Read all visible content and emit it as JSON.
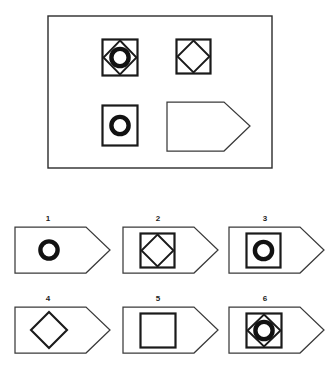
{
  "page": {
    "background_color": "#ffffff",
    "ink_color": "#1a1a1a",
    "width": 327,
    "height": 372
  },
  "problem_panel": {
    "name": "problem-matrix",
    "frame_shape": "rectangle",
    "frame": {
      "x": 48,
      "y": 16,
      "w": 224,
      "h": 152
    },
    "cells": [
      {
        "id": "cell-r1c1",
        "position": "row1-col1",
        "shapes": [
          "square",
          "diamond",
          "thick-circle"
        ],
        "box": {
          "x": 102,
          "y": 39,
          "w": 35,
          "h": 37
        }
      },
      {
        "id": "cell-r1c2",
        "position": "row1-col2",
        "shapes": [
          "square",
          "diamond"
        ],
        "box": {
          "x": 176,
          "y": 39,
          "w": 35,
          "h": 34
        }
      },
      {
        "id": "cell-r2c1",
        "position": "row2-col1",
        "shapes": [
          "square",
          "thick-circle"
        ],
        "box": {
          "x": 102,
          "y": 105,
          "w": 35,
          "h": 41
        }
      },
      {
        "id": "cell-r2c2-answer",
        "position": "row2-col2",
        "shapes": [
          "pentagon-tag"
        ],
        "is_answer_slot": true,
        "box": {
          "x": 166,
          "y": 101,
          "w": 85,
          "h": 50
        }
      }
    ]
  },
  "options_panel": {
    "name": "answer-options",
    "columns": 3,
    "rows": 2,
    "options": [
      {
        "number": "1",
        "label_x": 48,
        "label_y": 216,
        "tag": {
          "x": 14,
          "y": 226,
          "w": 83,
          "h": 48
        },
        "shapes": [
          "thick-circle"
        ]
      },
      {
        "number": "2",
        "label_x": 158,
        "label_y": 216,
        "tag": {
          "x": 122,
          "y": 226,
          "w": 83,
          "h": 48
        },
        "shapes": [
          "square",
          "diamond"
        ]
      },
      {
        "number": "3",
        "label_x": 265,
        "label_y": 216,
        "tag": {
          "x": 228,
          "y": 226,
          "w": 83,
          "h": 48
        },
        "shapes": [
          "square",
          "thick-circle"
        ]
      },
      {
        "number": "4",
        "label_x": 48,
        "label_y": 296,
        "tag": {
          "x": 14,
          "y": 306,
          "w": 83,
          "h": 48
        },
        "shapes": [
          "diamond"
        ]
      },
      {
        "number": "5",
        "label_x": 158,
        "label_y": 296,
        "tag": {
          "x": 122,
          "y": 306,
          "w": 83,
          "h": 48
        },
        "shapes": [
          "square"
        ]
      },
      {
        "number": "6",
        "label_x": 265,
        "label_y": 296,
        "tag": {
          "x": 228,
          "y": 306,
          "w": 83,
          "h": 48
        },
        "shapes": [
          "square",
          "diamond",
          "thick-circle"
        ]
      }
    ]
  },
  "style_values": {
    "frame_stroke_width": 1.3,
    "tag_stroke_width": 1.2,
    "square_stroke_width": 2.2,
    "diamond_stroke_width": 1.8,
    "circle_stroke_width": 4.2
  }
}
